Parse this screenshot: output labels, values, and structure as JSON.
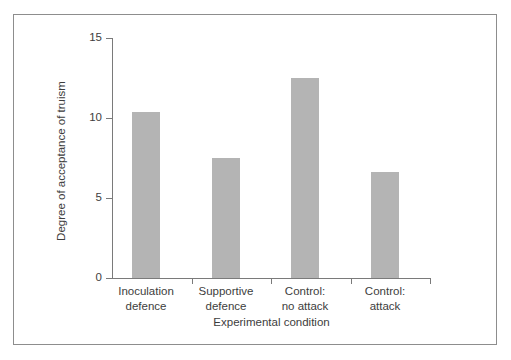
{
  "chart_data": {
    "type": "bar",
    "title": "",
    "categories": [
      "Inoculation defence",
      "Supportive defence",
      "Control: no attack",
      "Control: attack"
    ],
    "category_lines": [
      [
        "Inoculation",
        "defence"
      ],
      [
        "Supportive",
        "defence"
      ],
      [
        "Control:",
        "no attack"
      ],
      [
        "Control:",
        "attack"
      ]
    ],
    "values": [
      10.4,
      7.5,
      12.5,
      6.6
    ],
    "xlabel": "Experimental condition",
    "ylabel": "Degree of acceptance of truism",
    "ylim": [
      0,
      15
    ],
    "yticks": [
      0,
      5,
      10,
      15
    ],
    "ytick_labels": [
      "0",
      "5",
      "10",
      "15"
    ],
    "grid": false,
    "legend": false,
    "bar_color": "#b4b4b4",
    "axis_color": "#7a7a7a",
    "text_color": "#3d3d3d",
    "frame_color": "#8d8d8d"
  }
}
